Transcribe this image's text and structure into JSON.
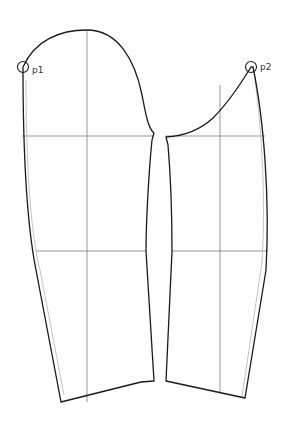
{
  "diagram": {
    "type": "sewing-pattern",
    "colors": {
      "outline": "#1a1a1a",
      "guide": "#6b6b6b",
      "ghost": "#b5b5b5",
      "background": "#ffffff"
    },
    "points": [
      {
        "id": "p1",
        "label": "p1",
        "x": 23,
        "y": 67
      },
      {
        "id": "p2",
        "label": "p2",
        "x": 251,
        "y": 67
      }
    ],
    "pieces": [
      {
        "name": "upper-sleeve",
        "side": "left"
      },
      {
        "name": "under-sleeve",
        "side": "right"
      }
    ],
    "guide_lines": {
      "bicep_y": 136,
      "elbow_y": 251,
      "left_center_x": 87,
      "right_center_x": 220
    }
  }
}
